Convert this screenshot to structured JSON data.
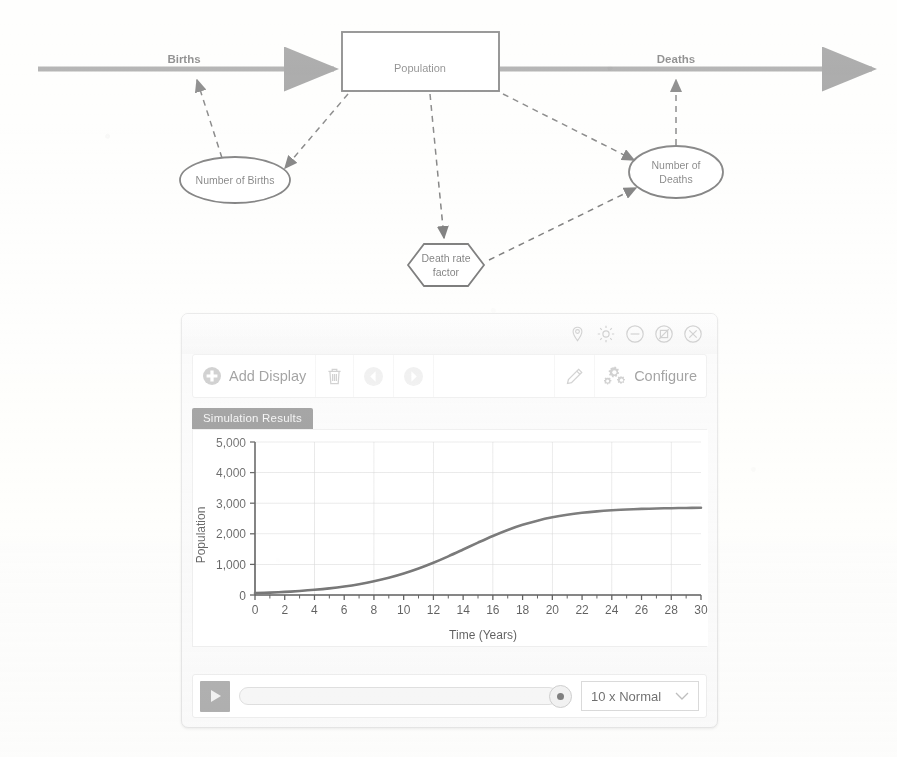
{
  "diagram": {
    "flows": [
      {
        "id": "births",
        "label": "Births"
      },
      {
        "id": "deaths",
        "label": "Deaths"
      }
    ],
    "stock": {
      "label": "Population",
      "shape": "rectangle"
    },
    "variables": [
      {
        "id": "number-of-births",
        "label": "Number of Births",
        "shape": "ellipse"
      },
      {
        "id": "number-of-deaths",
        "label": "Number of\nDeaths",
        "line1": "Number of",
        "line2": "Deaths",
        "shape": "ellipse"
      },
      {
        "id": "death-rate-factor",
        "label": "Death rate\nfactor",
        "line1": "Death rate",
        "line2": "factor",
        "shape": "hexagon"
      }
    ],
    "connections": [
      {
        "from": "number-of-births",
        "to": "births",
        "style": "dashed"
      },
      {
        "from": "population",
        "to": "number-of-births",
        "style": "dashed"
      },
      {
        "from": "population",
        "to": "death-rate-factor",
        "style": "dashed"
      },
      {
        "from": "population",
        "to": "number-of-deaths",
        "style": "dashed"
      },
      {
        "from": "death-rate-factor",
        "to": "number-of-deaths",
        "style": "dashed"
      },
      {
        "from": "number-of-deaths",
        "to": "deaths",
        "style": "dashed"
      }
    ]
  },
  "window": {
    "titlebar_icons": [
      {
        "name": "pin-icon",
        "tooltip": "Pin"
      },
      {
        "name": "gear-icon",
        "tooltip": "Settings"
      },
      {
        "name": "minimize-icon",
        "tooltip": "Minimize"
      },
      {
        "name": "maximize-icon",
        "tooltip": "Maximize"
      },
      {
        "name": "close-icon",
        "tooltip": "Close"
      }
    ],
    "toolbar": {
      "add_display_label": "Add Display",
      "delete_label": "",
      "back_label": "",
      "forward_label": "",
      "edit_label": "",
      "configure_label": "Configure"
    },
    "tabs": [
      {
        "label": "Simulation Results",
        "active": true
      }
    ],
    "bottom": {
      "play_label": "",
      "speed_value": "10 x Normal",
      "slider_position_percent": 100
    }
  },
  "chart_data": {
    "type": "line",
    "title": "",
    "xlabel": "Time (Years)",
    "ylabel": "Population",
    "xlim": [
      0,
      30
    ],
    "ylim": [
      0,
      5000
    ],
    "xticks": [
      0,
      2,
      4,
      6,
      8,
      10,
      12,
      14,
      16,
      18,
      20,
      22,
      24,
      26,
      28,
      30
    ],
    "xtick_labels": [
      "0",
      "2",
      "4",
      "6",
      "8",
      "10",
      "12",
      "14",
      "16",
      "18",
      "20",
      "22",
      "24",
      "26",
      "28",
      "30"
    ],
    "yticks": [
      0,
      1000,
      2000,
      3000,
      4000,
      5000
    ],
    "ytick_labels": [
      "0",
      "1,000",
      "2,000",
      "3,000",
      "4,000",
      "5,000"
    ],
    "grid": true,
    "grid_x_step": 4,
    "grid_y_step": 1000,
    "legend": null,
    "line_color": "#3c3c3c",
    "series": [
      {
        "name": "Population",
        "x": [
          0,
          1,
          2,
          3,
          4,
          5,
          6,
          7,
          8,
          9,
          10,
          11,
          12,
          13,
          14,
          15,
          16,
          17,
          18,
          19,
          20,
          21,
          22,
          23,
          24,
          25,
          26,
          27,
          28,
          29,
          30
        ],
        "values": [
          60,
          78,
          101,
          131,
          169,
          217,
          278,
          354,
          448,
          563,
          702,
          866,
          1054,
          1263,
          1486,
          1713,
          1930,
          2126,
          2293,
          2430,
          2539,
          2623,
          2686,
          2734,
          2769,
          2795,
          2813,
          2827,
          2837,
          2844,
          2849
        ]
      }
    ]
  }
}
